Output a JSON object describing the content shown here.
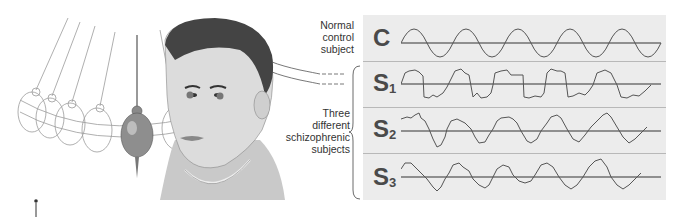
{
  "annotations": {
    "control_label": [
      "Normal",
      "control",
      "subject"
    ],
    "schizo_label": [
      "Three",
      "different",
      "schizophrenic",
      "subjects"
    ]
  },
  "traces": [
    {
      "id": "C",
      "label_main": "C",
      "label_sub": "",
      "description": "smooth sinusoid"
    },
    {
      "id": "S1",
      "label_main": "S",
      "label_sub": "1",
      "description": "square-ish noisy wave"
    },
    {
      "id": "S2",
      "label_main": "S",
      "label_sub": "2",
      "description": "noisy sinusoid"
    },
    {
      "id": "S3",
      "label_main": "S",
      "label_sub": "3",
      "description": "noisy sinusoid"
    }
  ],
  "illustration": {
    "subject": "head-with-pendulum",
    "description": "Man's head tracking a swinging pendulum (smooth pursuit eye tracking)"
  },
  "colors": {
    "panel_bg": "#ececec",
    "trace": "#555555",
    "baseline": "#333333",
    "label": "#4a4a4a",
    "pendulum_bob": "#8a8a8a"
  }
}
